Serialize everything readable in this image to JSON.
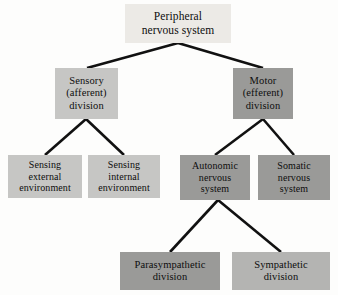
{
  "diagram": {
    "type": "tree-diagram",
    "background_color": "#fdfdfc",
    "connector_color": "#111111",
    "text_color": "#0d0d0d",
    "nodes": {
      "pns": {
        "label": "Peripheral\nnervous system",
        "level": 1,
        "fill": "#eceae6"
      },
      "sensory": {
        "label": "Sensory\n(afferent)\ndivision",
        "level": 2,
        "fill": "#c6c6c4"
      },
      "motor": {
        "label": "Motor\n(efferent)\ndivision",
        "level": 2,
        "fill": "#9a9a98"
      },
      "sensing_external": {
        "label": "Sensing\nexternal\nenvironment",
        "level": 3,
        "fill": "#c6c6c4"
      },
      "sensing_internal": {
        "label": "Sensing\ninternal\nenvironment",
        "level": 3,
        "fill": "#c6c6c4"
      },
      "autonomic": {
        "label": "Autonomic\nnervous\nsystem",
        "level": 3,
        "fill": "#9a9a98"
      },
      "somatic": {
        "label": "Somatic\nnervous\nsystem",
        "level": 3,
        "fill": "#9a9a98"
      },
      "parasympathetic": {
        "label": "Parasympathetic\ndivision",
        "level": 4,
        "fill": "#9a9a98"
      },
      "sympathetic": {
        "label": "Sympathetic\ndivision",
        "level": 4,
        "fill": "#b4b4b2"
      }
    },
    "edges": [
      {
        "from": "pns",
        "to": "sensory"
      },
      {
        "from": "pns",
        "to": "motor"
      },
      {
        "from": "sensory",
        "to": "sensing_external"
      },
      {
        "from": "sensory",
        "to": "sensing_internal"
      },
      {
        "from": "motor",
        "to": "autonomic"
      },
      {
        "from": "motor",
        "to": "somatic"
      },
      {
        "from": "autonomic",
        "to": "parasympathetic"
      },
      {
        "from": "autonomic",
        "to": "sympathetic"
      }
    ]
  }
}
